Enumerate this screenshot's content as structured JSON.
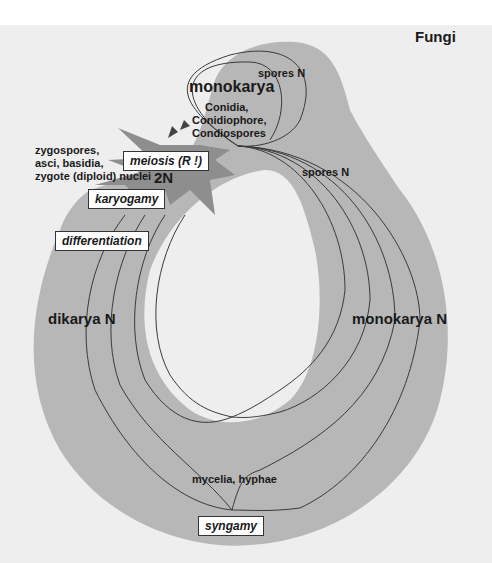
{
  "title": "Fungi",
  "colors": {
    "page_bg": "#ffffff",
    "panel_bg": "#eeeeee",
    "ring": "#b7b7b7",
    "dark_arrow": "#8e8e8e",
    "line": "#3a3a3a"
  },
  "labels": {
    "monokarya_top": "monokarya",
    "spores_n_top": "spores N",
    "conidia_1": "Conidia,",
    "conidia_2": "Conidiophore,",
    "conidia_3": "Condiospores",
    "spores_n_right": "spores N",
    "zygo_1": "zygospores,",
    "zygo_2": "asci, basidia,",
    "zygo_3": "zygote (diploid) nuclei",
    "two_n": "2N",
    "dikarya": "dikarya N",
    "monokarya_n": "monokarya N",
    "mycelia": "mycelia, hyphae"
  },
  "boxes": {
    "meiosis": "meiosis (R !)",
    "karyogamy": "karyogamy",
    "differentiation": "differentiation",
    "syngamy": "syngamy"
  }
}
